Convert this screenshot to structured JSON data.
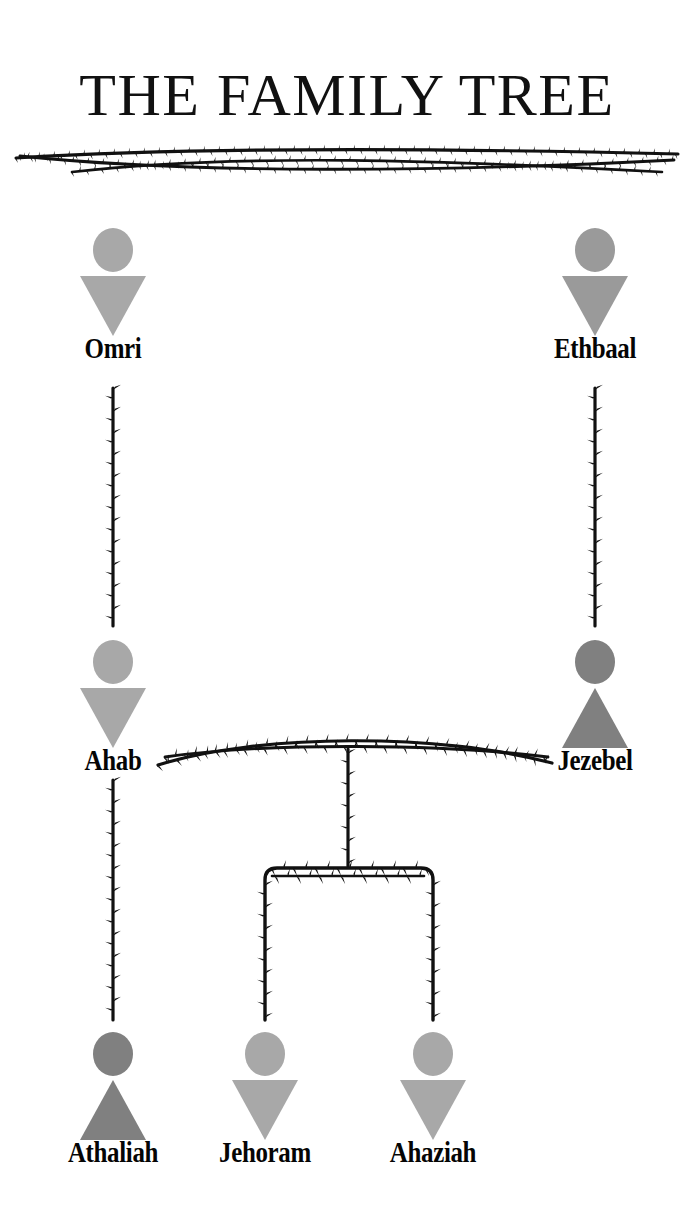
{
  "page": {
    "title": "THE FAMILY TREE",
    "background_color": "#ffffff",
    "divider_color": "#111111"
  },
  "legend": {
    "male_shape": "circle-over-downward-triangle",
    "female_shape": "circle-over-upward-triangle",
    "male_color": "#a8a8a8",
    "female_color": "#808080",
    "vine_color": "#111111"
  },
  "people": [
    {
      "id": "omri",
      "name": "Omri",
      "sex": "male",
      "color": "#a8a8a8",
      "generation": 1,
      "x": 113,
      "y": 228
    },
    {
      "id": "ethbaal",
      "name": "Ethbaal",
      "sex": "male",
      "color": "#9a9a9a",
      "generation": 1,
      "x": 595,
      "y": 228
    },
    {
      "id": "ahab",
      "name": "Ahab",
      "sex": "male",
      "color": "#a8a8a8",
      "generation": 2,
      "x": 113,
      "y": 640
    },
    {
      "id": "jezebel",
      "name": "Jezebel",
      "sex": "female",
      "color": "#808080",
      "generation": 2,
      "x": 595,
      "y": 640
    },
    {
      "id": "athaliah",
      "name": "Athaliah",
      "sex": "female",
      "color": "#808080",
      "generation": 3,
      "x": 113,
      "y": 1032
    },
    {
      "id": "jehoram",
      "name": "Jehoram",
      "sex": "male",
      "color": "#a8a8a8",
      "generation": 3,
      "x": 265,
      "y": 1032
    },
    {
      "id": "ahaziah",
      "name": "Ahaziah",
      "sex": "male",
      "color": "#a8a8a8",
      "generation": 3,
      "x": 433,
      "y": 1032
    }
  ],
  "relationships": [
    {
      "type": "parent-child",
      "from": "omri",
      "to": "ahab"
    },
    {
      "type": "parent-child",
      "from": "ethbaal",
      "to": "jezebel"
    },
    {
      "type": "marriage",
      "from": "ahab",
      "to": "jezebel"
    },
    {
      "type": "parent-child",
      "from": "ahab",
      "to": "athaliah"
    },
    {
      "type": "parent-child",
      "from": "ahab-jezebel",
      "to": "jehoram"
    },
    {
      "type": "parent-child",
      "from": "ahab-jezebel",
      "to": "ahaziah"
    }
  ]
}
